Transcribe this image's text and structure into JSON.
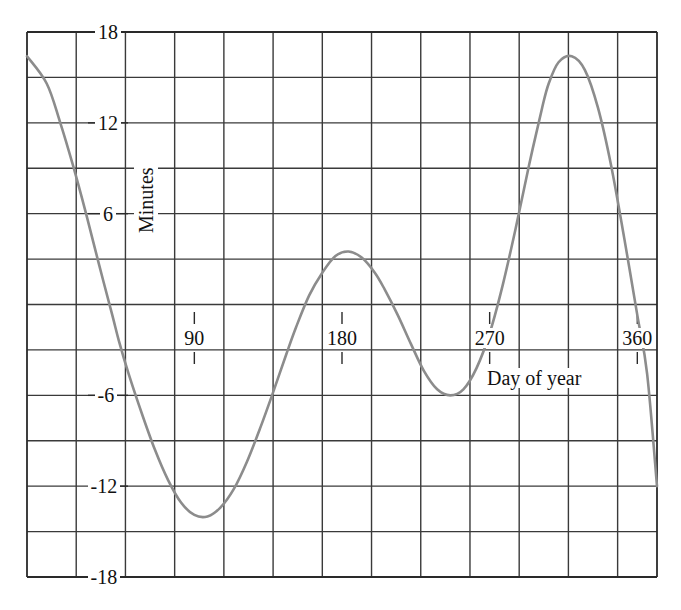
{
  "chart_data": {
    "type": "line",
    "title": "",
    "subtitle": "",
    "xlabel": "Day of year",
    "ylabel": "Minutes",
    "xlim": [
      -12,
      372
    ],
    "ylim": [
      -18,
      18
    ],
    "x_ticks": [
      90,
      180,
      270,
      360
    ],
    "x_tick_labels": [
      "90",
      "180",
      "270",
      "360"
    ],
    "y_ticks": [
      18,
      12,
      6,
      -6,
      -12,
      -18
    ],
    "y_tick_labels": [
      "18",
      "12",
      "6",
      "-6",
      "-12",
      "-18"
    ],
    "grid": true,
    "grid_x_step_days": 30,
    "grid_y_step_minutes": 3,
    "legend": "none",
    "line_color": "#8c8c8c",
    "grid_color": "#3a3a3a",
    "series": [
      {
        "name": "Equation of time",
        "x": [
          -12,
          0,
          8,
          16,
          24,
          32,
          40,
          44,
          50,
          58,
          66,
          74,
          82,
          90,
          98,
          106,
          114,
          122,
          130,
          138,
          146,
          152,
          160,
          168,
          176,
          184,
          192,
          200,
          206,
          214,
          222,
          230,
          238,
          246,
          254,
          262,
          270,
          278,
          286,
          294,
          302,
          306,
          312,
          320,
          328,
          336,
          344,
          352,
          360,
          366,
          372
        ],
        "y": [
          16.4,
          14.6,
          12.1,
          9.2,
          6.0,
          2.6,
          -0.7,
          -2.4,
          -4.6,
          -7.2,
          -9.6,
          -11.6,
          -13.1,
          -13.9,
          -14.0,
          -13.4,
          -12.2,
          -10.4,
          -8.2,
          -5.8,
          -3.3,
          -1.5,
          0.6,
          2.1,
          3.2,
          3.5,
          3.1,
          2.1,
          1.0,
          -0.7,
          -2.6,
          -4.4,
          -5.6,
          -6.0,
          -5.6,
          -4.2,
          -1.9,
          1.3,
          5.1,
          9.2,
          13.0,
          14.6,
          16.0,
          16.4,
          15.5,
          13.0,
          9.2,
          4.4,
          -0.7,
          -4.6,
          -12.0
        ]
      }
    ],
    "annotations": []
  },
  "axes": {
    "y_label": "Minutes",
    "x_label": "Day of year",
    "y_tick_labels": {
      "t18": "18",
      "t12": "12",
      "t6": "6",
      "tm6": "-6",
      "tm12": "-12",
      "tm18": "-18"
    },
    "x_tick_labels": {
      "t90": "90",
      "t180": "180",
      "t270": "270",
      "t360": "360"
    }
  }
}
